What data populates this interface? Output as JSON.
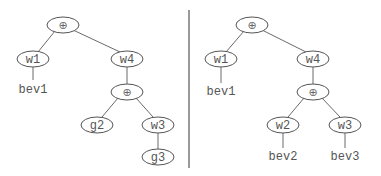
{
  "diagram": {
    "type": "tree-comparison",
    "operator_symbol": "⊕",
    "left_tree": {
      "nodes": {
        "root": {
          "label": "⊕"
        },
        "w1": {
          "label": "w1"
        },
        "w4": {
          "label": "w4"
        },
        "bev1": {
          "label": "bev1"
        },
        "op2": {
          "label": "⊕"
        },
        "g2": {
          "label": "g2"
        },
        "w3": {
          "label": "w3"
        },
        "g3": {
          "label": "g3"
        }
      },
      "edges": [
        [
          "root",
          "w1"
        ],
        [
          "root",
          "w4"
        ],
        [
          "w1",
          "bev1"
        ],
        [
          "w4",
          "op2"
        ],
        [
          "op2",
          "g2"
        ],
        [
          "op2",
          "w3"
        ],
        [
          "w3",
          "g3"
        ]
      ]
    },
    "right_tree": {
      "nodes": {
        "root": {
          "label": "⊕"
        },
        "w1": {
          "label": "w1"
        },
        "w4": {
          "label": "w4"
        },
        "bev1": {
          "label": "bev1"
        },
        "op2": {
          "label": "⊕"
        },
        "w2": {
          "label": "w2"
        },
        "w3": {
          "label": "w3"
        },
        "bev2": {
          "label": "bev2"
        },
        "bev3": {
          "label": "bev3"
        }
      },
      "edges": [
        [
          "root",
          "w1"
        ],
        [
          "root",
          "w4"
        ],
        [
          "w1",
          "bev1"
        ],
        [
          "w4",
          "op2"
        ],
        [
          "op2",
          "w2"
        ],
        [
          "op2",
          "w3"
        ],
        [
          "w2",
          "bev2"
        ],
        [
          "w3",
          "bev3"
        ]
      ]
    }
  }
}
